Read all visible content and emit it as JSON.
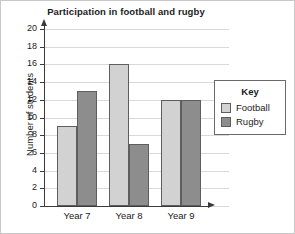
{
  "chart_data": {
    "type": "bar",
    "title": "Participation in football and rugby",
    "xlabel": "",
    "ylabel": "Number of students",
    "categories": [
      "Year 7",
      "Year 8",
      "Year 9"
    ],
    "series": [
      {
        "name": "Football",
        "values": [
          9,
          16,
          12
        ],
        "color": "#d2d2d2"
      },
      {
        "name": "Rugby",
        "values": [
          13,
          7,
          12
        ],
        "color": "#8d8d8d"
      }
    ],
    "ylim": [
      0,
      20
    ],
    "ytick_step": 2,
    "yticks": [
      0,
      2,
      4,
      6,
      8,
      10,
      12,
      14,
      16,
      18,
      20
    ],
    "grid": true,
    "legend_position": "right",
    "legend_title": "Key"
  },
  "legend": {
    "title": "Key",
    "entries": [
      {
        "label": "Football",
        "swatch": "football"
      },
      {
        "label": "Rugby",
        "swatch": "rugby"
      }
    ]
  },
  "axes": {
    "y_arrow_icon": "arrow-up-icon",
    "x_arrow_icon": "arrow-right-icon"
  }
}
